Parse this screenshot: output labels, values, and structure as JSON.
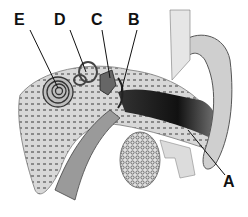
{
  "diagram": {
    "labels": [
      {
        "id": "A",
        "text": "A",
        "x": 223,
        "y": 174
      },
      {
        "id": "B",
        "text": "B",
        "x": 128,
        "y": 12
      },
      {
        "id": "C",
        "text": "C",
        "x": 91,
        "y": 12
      },
      {
        "id": "D",
        "text": "D",
        "x": 54,
        "y": 12
      },
      {
        "id": "E",
        "text": "E",
        "x": 14,
        "y": 12
      }
    ]
  }
}
